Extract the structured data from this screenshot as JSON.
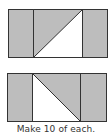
{
  "colors": {
    "fill": "#bdbdbd",
    "stroke": "#333333",
    "background": "#ffffff"
  },
  "blocks": [
    {
      "name": "block-top",
      "diagonal": "bottom-left-to-top-right",
      "shaded_triangle": "upper-left"
    },
    {
      "name": "block-bottom",
      "diagonal": "top-left-to-bottom-right",
      "shaded_triangle": "upper-right"
    }
  ],
  "caption": "Make 10 of each."
}
